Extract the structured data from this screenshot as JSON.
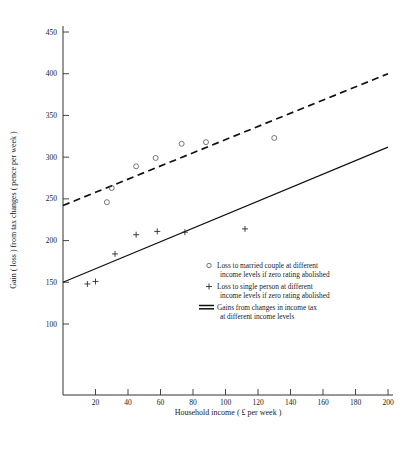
{
  "chart_data": {
    "type": "scatter",
    "title": "",
    "xlabel": "Household income ( £ per week )",
    "ylabel": "Gain ( loss ) from tax changes ( pence per week )",
    "xlim": [
      0,
      200
    ],
    "ylim": [
      85,
      460
    ],
    "xticks": [
      20,
      40,
      60,
      80,
      100,
      120,
      140,
      160,
      180,
      200
    ],
    "xtick_labels": [
      "20",
      "40",
      "60",
      "80",
      "100",
      "120",
      "140",
      "160",
      "180",
      "200"
    ],
    "yticks": [
      100,
      150,
      200,
      250,
      300,
      350,
      400,
      450
    ],
    "ytick_labels": [
      "100",
      "150",
      "200",
      "250",
      "300",
      "350",
      "400",
      "450"
    ],
    "grid": false,
    "legend_position": "inside-lower-right",
    "series": [
      {
        "name": "Loss to married couple at different income levels if zero rating abolished",
        "marker": "circle",
        "points": [
          {
            "x": 27,
            "y": 246
          },
          {
            "x": 30,
            "y": 263
          },
          {
            "x": 45,
            "y": 289
          },
          {
            "x": 57,
            "y": 299
          },
          {
            "x": 73,
            "y": 316
          },
          {
            "x": 88,
            "y": 318
          },
          {
            "x": 130,
            "y": 323
          }
        ]
      },
      {
        "name": "Loss to single person at different income levels if zero rating abolished",
        "marker": "plus",
        "points": [
          {
            "x": 15,
            "y": 148
          },
          {
            "x": 20,
            "y": 151
          },
          {
            "x": 32,
            "y": 184
          },
          {
            "x": 45,
            "y": 207
          },
          {
            "x": 58,
            "y": 211
          },
          {
            "x": 75,
            "y": 210
          },
          {
            "x": 112,
            "y": 214
          }
        ]
      },
      {
        "name": "Gains from changes in income tax at different income levels",
        "marker": "dashed-line",
        "line_style": "dashed",
        "endpoints": [
          {
            "x": 0,
            "y": 242
          },
          {
            "x": 200,
            "y": 400
          }
        ]
      },
      {
        "name": "Solid trend line",
        "marker": "solid-line",
        "line_style": "solid",
        "endpoints": [
          {
            "x": 0,
            "y": 150
          },
          {
            "x": 200,
            "y": 312
          }
        ]
      }
    ]
  },
  "legend": {
    "entries": [
      {
        "marker": "circle",
        "line1": "Loss to married couple at different",
        "line2": "income levels if zero rating abolished"
      },
      {
        "marker": "plus",
        "line1": "Loss to single person at different",
        "line2": "income levels if zero rating abolished"
      },
      {
        "marker": "double-dash",
        "line1": "Gains from changes in income tax",
        "line2": "at different income levels"
      }
    ]
  }
}
